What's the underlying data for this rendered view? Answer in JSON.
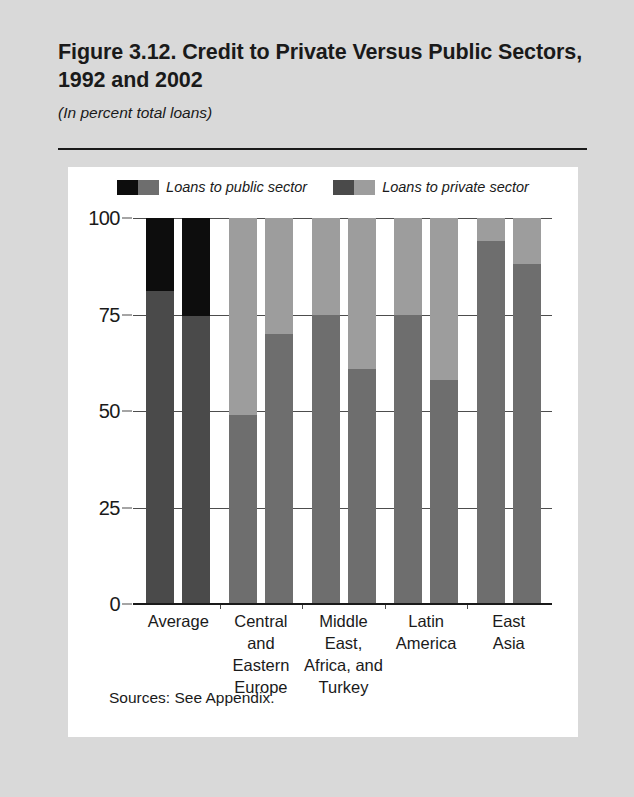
{
  "figure": {
    "title": "Figure 3.12. Credit to Private Versus Public Sectors, 1992 and 2002",
    "subtitle": "(In percent total loans)",
    "source_note": "Sources: See Appendix."
  },
  "colors": {
    "page_background": "#d9d9d9",
    "card_background": "#ffffff",
    "public_1992": "#0d0d0d",
    "public_2002": "#6e6e6e",
    "private_1992": "#4a4a4a",
    "private_2002": "#9d9d9d",
    "axis": "#1a1a1a",
    "gridline": "#4d4d4d",
    "text": "#1a1a1a"
  },
  "legend": {
    "position": "top-center",
    "entries": [
      {
        "label": "Loans to public sector",
        "swatch_left": "#0d0d0d",
        "swatch_right": "#6e6e6e"
      },
      {
        "label": "Loans to private sector",
        "swatch_left": "#4a4a4a",
        "swatch_right": "#9d9d9d"
      }
    ]
  },
  "chart_data": {
    "type": "bar",
    "subtype": "stacked-grouped",
    "title": "Figure 3.12. Credit to Private Versus Public Sectors, 1992 and 2002",
    "subtitle": "(In percent total loans)",
    "xlabel": "",
    "ylabel": "",
    "ylim": [
      0,
      100
    ],
    "yticks": [
      0,
      25,
      50,
      75,
      100
    ],
    "ytick_labels": [
      "0",
      "25",
      "50",
      "75",
      "100"
    ],
    "grid": true,
    "grid_axis": "y",
    "legend_position": "top-center",
    "categories": [
      "Average",
      "Central and Eastern Europe",
      "Middle East, Africa, and Turkey",
      "Latin America",
      "East Asia"
    ],
    "category_label_lines": [
      [
        "Average"
      ],
      [
        "Central",
        "and",
        "Eastern",
        "Europe"
      ],
      [
        "Middle",
        "East,",
        "Africa, and",
        "Turkey"
      ],
      [
        "Latin",
        "America"
      ],
      [
        "East",
        "Asia"
      ]
    ],
    "subgroups": [
      "1992",
      "2002"
    ],
    "series": [
      {
        "name": "Loans to private sector",
        "values_1992": [
          81,
          49,
          75,
          75,
          94
        ],
        "values_2002": [
          74.5,
          70,
          61,
          58,
          88
        ]
      },
      {
        "name": "Loans to public sector",
        "values_1992": [
          19,
          51,
          25,
          25,
          6
        ],
        "values_2002": [
          25.5,
          30,
          39,
          42,
          12
        ]
      }
    ],
    "bars": [
      {
        "category": "Average",
        "year": "1992",
        "private": 81,
        "public": 19,
        "private_color": "#4a4a4a",
        "public_color": "#0d0d0d"
      },
      {
        "category": "Average",
        "year": "2002",
        "private": 74.5,
        "public": 25.5,
        "private_color": "#4a4a4a",
        "public_color": "#0d0d0d"
      },
      {
        "category": "Central and Eastern Europe",
        "year": "1992",
        "private": 49,
        "public": 51,
        "private_color": "#6e6e6e",
        "public_color": "#9d9d9d"
      },
      {
        "category": "Central and Eastern Europe",
        "year": "2002",
        "private": 70,
        "public": 30,
        "private_color": "#6e6e6e",
        "public_color": "#9d9d9d"
      },
      {
        "category": "Middle East, Africa, and Turkey",
        "year": "1992",
        "private": 75,
        "public": 25,
        "private_color": "#6e6e6e",
        "public_color": "#9d9d9d"
      },
      {
        "category": "Middle East, Africa, and Turkey",
        "year": "2002",
        "private": 61,
        "public": 39,
        "private_color": "#6e6e6e",
        "public_color": "#9d9d9d"
      },
      {
        "category": "Latin America",
        "year": "1992",
        "private": 75,
        "public": 25,
        "private_color": "#6e6e6e",
        "public_color": "#9d9d9d"
      },
      {
        "category": "Latin America",
        "year": "2002",
        "private": 58,
        "public": 42,
        "private_color": "#6e6e6e",
        "public_color": "#9d9d9d"
      },
      {
        "category": "East Asia",
        "year": "1992",
        "private": 94,
        "public": 6,
        "private_color": "#6e6e6e",
        "public_color": "#9d9d9d"
      },
      {
        "category": "East Asia",
        "year": "2002",
        "private": 88,
        "public": 12,
        "private_color": "#6e6e6e",
        "public_color": "#9d9d9d"
      }
    ]
  }
}
